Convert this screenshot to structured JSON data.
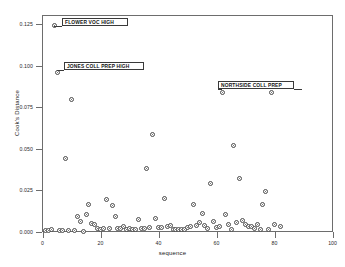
{
  "chart_data": {
    "type": "scatter",
    "title": "",
    "xlabel": "sequence",
    "ylabel": "Cook's Distance",
    "xlim": [
      0,
      100
    ],
    "ylim": [
      0.0,
      0.1302
    ],
    "xticks": [
      0,
      20,
      40,
      60,
      80,
      100
    ],
    "xticklabels": [
      "0",
      "20",
      "40",
      "60",
      "80",
      "100"
    ],
    "yticks": [
      0.0,
      0.025,
      0.05,
      0.075,
      0.1,
      0.125
    ],
    "yticklabels": [
      "0.000",
      "0.025",
      "0.050",
      "0.075",
      "0.100",
      "0.125"
    ],
    "grid": false,
    "legend": null,
    "marker": "open-circle",
    "points": [
      {
        "x": 1,
        "y": 0.0005
      },
      {
        "x": 2,
        "y": 0.0006
      },
      {
        "x": 3,
        "y": 0.0012
      },
      {
        "x": 4,
        "y": 0.1243
      },
      {
        "x": 5,
        "y": 0.0958
      },
      {
        "x": 6,
        "y": 0.0007
      },
      {
        "x": 7,
        "y": 0.0008
      },
      {
        "x": 8,
        "y": 0.0443
      },
      {
        "x": 9,
        "y": 0.0008
      },
      {
        "x": 10,
        "y": 0.0793
      },
      {
        "x": 11,
        "y": 0.0009
      },
      {
        "x": 12,
        "y": 0.009
      },
      {
        "x": 13,
        "y": 0.0062
      },
      {
        "x": 14,
        "y": 0.0002
      },
      {
        "x": 15,
        "y": 0.0104
      },
      {
        "x": 16,
        "y": 0.016
      },
      {
        "x": 17,
        "y": 0.0047
      },
      {
        "x": 18,
        "y": 0.0044
      },
      {
        "x": 19,
        "y": 0.0017
      },
      {
        "x": 20,
        "y": 0.0013
      },
      {
        "x": 21,
        "y": 0.0016
      },
      {
        "x": 22,
        "y": 0.019
      },
      {
        "x": 23,
        "y": 0.0021
      },
      {
        "x": 24,
        "y": 0.0155
      },
      {
        "x": 25,
        "y": 0.0089
      },
      {
        "x": 26,
        "y": 0.0021
      },
      {
        "x": 27,
        "y": 0.0016
      },
      {
        "x": 28,
        "y": 0.0029
      },
      {
        "x": 29,
        "y": 0.0012
      },
      {
        "x": 30,
        "y": 0.002
      },
      {
        "x": 31,
        "y": 0.001
      },
      {
        "x": 32,
        "y": 0.0014
      },
      {
        "x": 33,
        "y": 0.0075
      },
      {
        "x": 34,
        "y": 0.002
      },
      {
        "x": 35,
        "y": 0.0019
      },
      {
        "x": 36,
        "y": 0.038
      },
      {
        "x": 37,
        "y": 0.0022
      },
      {
        "x": 38,
        "y": 0.0584
      },
      {
        "x": 39,
        "y": 0.0081
      },
      {
        "x": 40,
        "y": 0.0024
      },
      {
        "x": 41,
        "y": 0.0025
      },
      {
        "x": 42,
        "y": 0.0198
      },
      {
        "x": 43,
        "y": 0.003
      },
      {
        "x": 44,
        "y": 0.0036
      },
      {
        "x": 45,
        "y": 0.0013
      },
      {
        "x": 46,
        "y": 0.0014
      },
      {
        "x": 47,
        "y": 0.0011
      },
      {
        "x": 48,
        "y": 0.0012
      },
      {
        "x": 49,
        "y": 0.0013
      },
      {
        "x": 50,
        "y": 0.0024
      },
      {
        "x": 51,
        "y": 0.003
      },
      {
        "x": 52,
        "y": 0.0161
      },
      {
        "x": 53,
        "y": 0.0034
      },
      {
        "x": 54,
        "y": 0.0052
      },
      {
        "x": 55,
        "y": 0.0109
      },
      {
        "x": 56,
        "y": 0.0035
      },
      {
        "x": 57,
        "y": 0.0021
      },
      {
        "x": 58,
        "y": 0.029
      },
      {
        "x": 59,
        "y": 0.0059
      },
      {
        "x": 60,
        "y": 0.0024
      },
      {
        "x": 61,
        "y": 0.003
      },
      {
        "x": 62,
        "y": 0.0838
      },
      {
        "x": 63,
        "y": 0.01
      },
      {
        "x": 64,
        "y": 0.0044
      },
      {
        "x": 65,
        "y": 0.0013
      },
      {
        "x": 66,
        "y": 0.0517
      },
      {
        "x": 67,
        "y": 0.0055
      },
      {
        "x": 68,
        "y": 0.0319
      },
      {
        "x": 69,
        "y": 0.0066
      },
      {
        "x": 70,
        "y": 0.004
      },
      {
        "x": 71,
        "y": 0.0028
      },
      {
        "x": 72,
        "y": 0.003
      },
      {
        "x": 73,
        "y": 0.0021
      },
      {
        "x": 74,
        "y": 0.0042
      },
      {
        "x": 75,
        "y": 0.0015
      },
      {
        "x": 76,
        "y": 0.016
      },
      {
        "x": 77,
        "y": 0.0242
      },
      {
        "x": 78,
        "y": 0.0012
      },
      {
        "x": 79,
        "y": 0.0835
      },
      {
        "x": 80,
        "y": 0.0044
      },
      {
        "x": 82,
        "y": 0.003
      }
    ],
    "annotations": [
      {
        "label": "FLOWER VOC HIGH",
        "point_x": 4,
        "point_y": 0.1243
      },
      {
        "label": "JONES COLL PREP HIGH",
        "point_x": 5,
        "point_y": 0.0958
      },
      {
        "label": "NORTHSIDE COLL PREP",
        "point_x": 62,
        "point_y": 0.0838
      }
    ]
  },
  "colors": {
    "frame": "#6d6d6d",
    "marker_edge": "#4a4a4a",
    "background": "#ffffff",
    "text": "#1a1a1a"
  }
}
